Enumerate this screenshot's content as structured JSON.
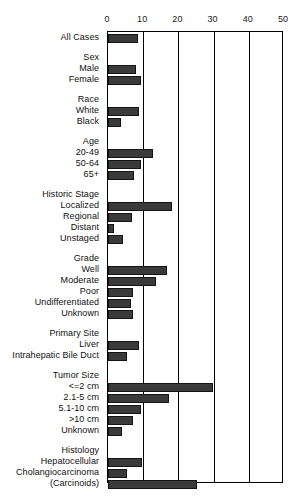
{
  "chart_data": {
    "type": "bar",
    "orientation": "horizontal",
    "title": "",
    "subtitle": "",
    "xlabel": "",
    "ylabel": "",
    "xlim": [
      0,
      50
    ],
    "xticks": [
      0,
      10,
      20,
      30,
      40,
      50
    ],
    "xticklabels": [
      "0",
      "10",
      "20",
      "30",
      "40",
      "50"
    ],
    "grid": true,
    "grid_axis": "x",
    "legend": null,
    "bar_color": "#3a3a3a",
    "bar_edge_color": "#141414",
    "axis_color": "#000000",
    "categories": [
      "All Cases",
      "Sex",
      "Male",
      "Female",
      "Race",
      "White",
      "Black",
      "Age",
      "20-49",
      "50-64",
      "65+",
      "Historic Stage",
      "Localized",
      "Regional",
      "Distant",
      "Unstaged",
      "Grade",
      "Well",
      "Moderate",
      "Poor",
      "Undifferentiated",
      "Unknown",
      "Primary Site",
      "Liver",
      "Intrahepatic Bile Duct",
      "Tumor Size",
      "<=2 cm",
      "2.1-5 cm",
      "5.1-10 cm",
      ">10 cm",
      "Unknown",
      "Histology",
      "Hepatocellular",
      "Cholangiocarcinoma",
      "(Carcinoids)"
    ],
    "values": [
      8.5,
      null,
      8.0,
      9.4,
      null,
      8.8,
      3.7,
      null,
      12.8,
      9.4,
      7.4,
      null,
      18.2,
      6.8,
      1.7,
      4.3,
      null,
      16.8,
      13.6,
      7.0,
      6.5,
      7.0,
      null,
      8.8,
      5.4,
      null,
      29.8,
      17.3,
      9.4,
      7.1,
      4.0,
      null,
      9.7,
      5.4,
      25.3
    ],
    "rows": [
      {
        "label": "All Cases",
        "value": 8.5,
        "header": false,
        "gap_before": 0
      },
      {
        "label": "Sex",
        "value": null,
        "header": true,
        "gap_before": 9
      },
      {
        "label": "Male",
        "value": 8.0,
        "header": false,
        "gap_before": 0
      },
      {
        "label": "Female",
        "value": 9.4,
        "header": false,
        "gap_before": 0
      },
      {
        "label": "Race",
        "value": null,
        "header": true,
        "gap_before": 9
      },
      {
        "label": "White",
        "value": 8.8,
        "header": false,
        "gap_before": 0
      },
      {
        "label": "Black",
        "value": 3.7,
        "header": false,
        "gap_before": 0
      },
      {
        "label": "Age",
        "value": null,
        "header": true,
        "gap_before": 9
      },
      {
        "label": "20-49",
        "value": 12.8,
        "header": false,
        "gap_before": 0
      },
      {
        "label": "50-64",
        "value": 9.4,
        "header": false,
        "gap_before": 0
      },
      {
        "label": "65+",
        "value": 7.4,
        "header": false,
        "gap_before": 0
      },
      {
        "label": "Historic Stage",
        "value": null,
        "header": true,
        "gap_before": 9
      },
      {
        "label": "Localized",
        "value": 18.2,
        "header": false,
        "gap_before": 0
      },
      {
        "label": "Regional",
        "value": 6.8,
        "header": false,
        "gap_before": 0
      },
      {
        "label": "Distant",
        "value": 1.7,
        "header": false,
        "gap_before": 0
      },
      {
        "label": "Unstaged",
        "value": 4.3,
        "header": false,
        "gap_before": 0
      },
      {
        "label": "Grade",
        "value": null,
        "header": true,
        "gap_before": 9
      },
      {
        "label": "Well",
        "value": 16.8,
        "header": false,
        "gap_before": 0
      },
      {
        "label": "Moderate",
        "value": 13.6,
        "header": false,
        "gap_before": 0
      },
      {
        "label": "Poor",
        "value": 7.0,
        "header": false,
        "gap_before": 0
      },
      {
        "label": "Undifferentiated",
        "value": 6.5,
        "header": false,
        "gap_before": 0
      },
      {
        "label": "Unknown",
        "value": 7.0,
        "header": false,
        "gap_before": 0
      },
      {
        "label": "Primary Site",
        "value": null,
        "header": true,
        "gap_before": 9
      },
      {
        "label": "Liver",
        "value": 8.8,
        "header": false,
        "gap_before": 0
      },
      {
        "label": "Intrahepatic Bile Duct",
        "value": 5.4,
        "header": false,
        "gap_before": 0
      },
      {
        "label": "Tumor Size",
        "value": null,
        "header": true,
        "gap_before": 9
      },
      {
        "label": "<=2 cm",
        "value": 29.8,
        "header": false,
        "gap_before": 0
      },
      {
        "label": "2.1-5 cm",
        "value": 17.3,
        "header": false,
        "gap_before": 0
      },
      {
        "label": "5.1-10 cm",
        "value": 9.4,
        "header": false,
        "gap_before": 0
      },
      {
        "label": ">10 cm",
        "value": 7.1,
        "header": false,
        "gap_before": 0
      },
      {
        "label": "Unknown",
        "value": 4.0,
        "header": false,
        "gap_before": 0
      },
      {
        "label": "Histology",
        "value": null,
        "header": true,
        "gap_before": 9
      },
      {
        "label": "Hepatocellular",
        "value": 9.7,
        "header": false,
        "gap_before": 0
      },
      {
        "label": "Cholangiocarcinoma",
        "value": 5.4,
        "header": false,
        "gap_before": 0
      },
      {
        "label": "(Carcinoids)",
        "value": 25.3,
        "header": false,
        "gap_before": 0
      }
    ]
  }
}
